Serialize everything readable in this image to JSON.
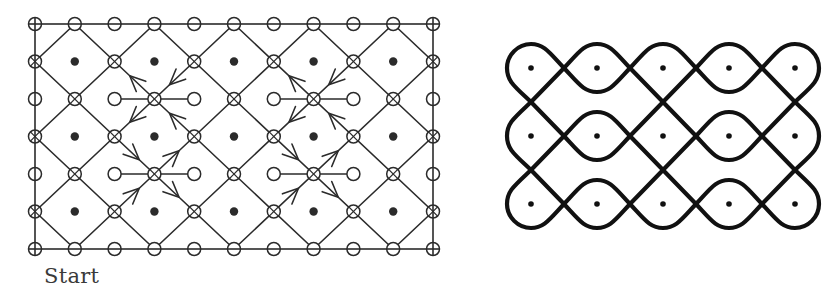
{
  "left_figure": {
    "label": "Start",
    "stroke_color": "#2b2b2b",
    "grid": {
      "cols": 11,
      "rows": 7,
      "x0": 35,
      "y0": 24,
      "dx": 39.8,
      "dy": 37.5
    },
    "node_types": {
      "border": "open-circle",
      "odd_row_even_col": "crossed-circle",
      "odd_row_odd_col": "dot",
      "even_row_odd_col": "crossed-circle",
      "even_row_even_col": "open-circle"
    },
    "horizontal_segments": [
      {
        "row": 2,
        "from_col": 2,
        "to_col": 4
      },
      {
        "row": 2,
        "from_col": 6,
        "to_col": 8
      },
      {
        "row": 4,
        "from_col": 2,
        "to_col": 4
      },
      {
        "row": 4,
        "from_col": 6,
        "to_col": 8
      }
    ],
    "arrow_groups": [
      {
        "center_col": 3,
        "center_row": 2,
        "pattern": "top"
      },
      {
        "center_col": 7,
        "center_row": 2,
        "pattern": "top"
      },
      {
        "center_col": 3,
        "center_row": 4,
        "pattern": "bottom"
      },
      {
        "center_col": 7,
        "center_row": 4,
        "pattern": "bottom"
      }
    ],
    "arrow_patterns": {
      "top": [
        {
          "quadrant": "upper-left",
          "direction": "away"
        },
        {
          "quadrant": "upper-right",
          "direction": "toward"
        },
        {
          "quadrant": "lower-left",
          "direction": "away"
        },
        {
          "quadrant": "lower-right",
          "direction": "toward"
        }
      ],
      "bottom": [
        {
          "quadrant": "upper-left",
          "direction": "toward"
        },
        {
          "quadrant": "upper-right",
          "direction": "away"
        },
        {
          "quadrant": "lower-left",
          "direction": "toward"
        },
        {
          "quadrant": "lower-right",
          "direction": "away"
        }
      ]
    }
  },
  "right_figure": {
    "title": "kolam",
    "stroke_color": "#111111",
    "dots": {
      "xs": [
        531,
        597,
        663,
        729,
        795
      ],
      "ys": [
        68,
        136,
        204
      ],
      "hx": 33,
      "hy": 34
    },
    "cells": [
      [
        "corner-tl",
        "eye",
        "top-cap",
        "eye",
        "corner-tr"
      ],
      [
        "left-cap",
        "eye",
        "diamond",
        "eye",
        "right-cap"
      ],
      [
        "corner-bl",
        "eye",
        "bottom-cap",
        "eye",
        "corner-br"
      ]
    ]
  }
}
